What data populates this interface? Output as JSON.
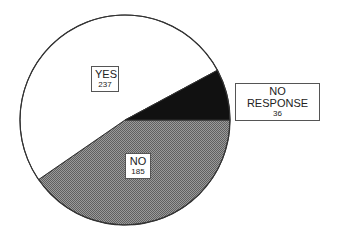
{
  "chart_data": {
    "type": "pie",
    "title": "",
    "categories": [
      "YES",
      "NO",
      "NO RESPONSE"
    ],
    "values": [
      237,
      185,
      36
    ],
    "total": 458,
    "slices": [
      {
        "label": "YES",
        "value": 237,
        "fill": "#ffffff",
        "pattern": "solid"
      },
      {
        "label": "NO",
        "value": 185,
        "fill": "#808080",
        "pattern": "dither"
      },
      {
        "label": "NO RESPONSE",
        "value": 36,
        "fill": "#111111",
        "pattern": "solid"
      }
    ],
    "legend": "none (labels placed in boxes on/near slices)",
    "outline_color": "#333333"
  },
  "labels": {
    "yes": {
      "name": "YES",
      "value": "237"
    },
    "no": {
      "name": "NO",
      "value": "185"
    },
    "no_response": {
      "name": "NO RESPONSE",
      "value": "36"
    }
  }
}
